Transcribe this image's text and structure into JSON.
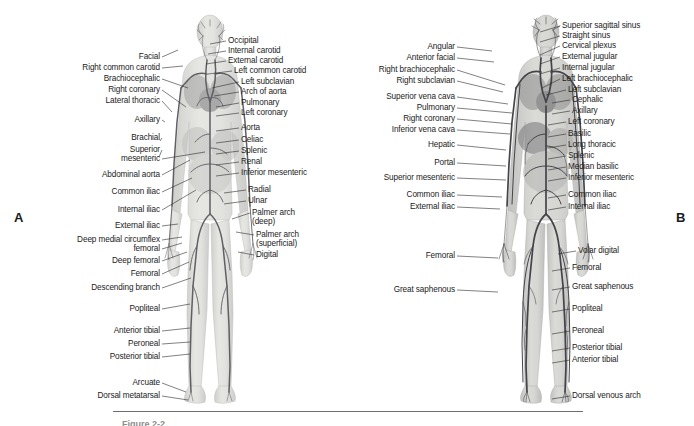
{
  "figure": {
    "background_color": "#ffffff",
    "text_color": "#1b1b1b",
    "leader_color": "#2b2b2b",
    "rule_color": "#6d6d6d"
  },
  "panel_a": {
    "letter": "A",
    "subject": "arterial-system",
    "art_tone_light": "#d9d9d6",
    "art_tone_vessel": "#6e6e72",
    "labels_left": [
      {
        "text": "Facial",
        "x": 160,
        "y": 57,
        "tx": 205,
        "ty": 60,
        "px": 178,
        "py": 50
      },
      {
        "text": "Right common carotid",
        "x": 160,
        "y": 68,
        "tx": 205,
        "ty": 71,
        "px": 183,
        "py": 66
      },
      {
        "text": "Brachiocephalic",
        "x": 160,
        "y": 79,
        "tx": 205,
        "ty": 82,
        "px": 188,
        "py": 88
      },
      {
        "text": "Right coronary",
        "x": 160,
        "y": 90,
        "tx": 205,
        "ty": 93,
        "px": 186,
        "py": 107
      },
      {
        "text": "Lateral thoracic",
        "x": 160,
        "y": 101,
        "tx": 205,
        "ty": 104,
        "px": 172,
        "py": 112
      },
      {
        "text": "Axillary",
        "x": 160,
        "y": 120,
        "tx": 205,
        "ty": 123,
        "px": 165,
        "py": 122
      },
      {
        "text": "Brachial",
        "x": 160,
        "y": 138,
        "tx": 205,
        "ty": 141,
        "px": 160,
        "py": 141
      },
      {
        "text": "Superior",
        "x": 160,
        "y": 150,
        "tx": 205,
        "ty": 153,
        "px": 159,
        "py": 157
      },
      {
        "text": "mesenteric",
        "x": 160,
        "y": 159,
        "tx": 205,
        "ty": 162,
        "px": 205,
        "py": 152
      },
      {
        "text": "Abdominal aorta",
        "x": 160,
        "y": 175,
        "tx": 205,
        "ty": 178,
        "px": 190,
        "py": 160
      },
      {
        "text": "Common iliac",
        "x": 160,
        "y": 192,
        "tx": 205,
        "ty": 195,
        "px": 192,
        "py": 178
      },
      {
        "text": "Internal iliac",
        "x": 160,
        "y": 210,
        "tx": 205,
        "ty": 213,
        "px": 196,
        "py": 190
      },
      {
        "text": "External iliac",
        "x": 160,
        "y": 226,
        "tx": 205,
        "ty": 229,
        "px": 178,
        "py": 224
      },
      {
        "text": "Deep medial circumflex",
        "x": 160,
        "y": 240,
        "tx": 205,
        "ty": 243,
        "px": 182,
        "py": 237
      },
      {
        "text": "femoral",
        "x": 160,
        "y": 249,
        "tx": 205,
        "ty": 252,
        "px": 182,
        "py": 243
      },
      {
        "text": "Deep femoral",
        "x": 160,
        "y": 261,
        "tx": 205,
        "ty": 264,
        "px": 187,
        "py": 252
      },
      {
        "text": "Femoral",
        "x": 160,
        "y": 274,
        "tx": 205,
        "ty": 277,
        "px": 189,
        "py": 262
      },
      {
        "text": "Descending branch",
        "x": 160,
        "y": 288,
        "tx": 205,
        "ty": 291,
        "px": 191,
        "py": 278
      },
      {
        "text": "Popliteal",
        "x": 160,
        "y": 309,
        "tx": 205,
        "ty": 312,
        "px": 190,
        "py": 304
      },
      {
        "text": "Anterior tibial",
        "x": 160,
        "y": 331,
        "tx": 205,
        "ty": 334,
        "px": 190,
        "py": 328
      },
      {
        "text": "Peroneal",
        "x": 160,
        "y": 344,
        "tx": 205,
        "ty": 347,
        "px": 190,
        "py": 342
      },
      {
        "text": "Posterior tibial",
        "x": 160,
        "y": 357,
        "tx": 205,
        "ty": 360,
        "px": 190,
        "py": 354
      },
      {
        "text": "Arcuate",
        "x": 160,
        "y": 383,
        "tx": 205,
        "ty": 386,
        "px": 186,
        "py": 392
      },
      {
        "text": "Dorsal metatarsal",
        "x": 160,
        "y": 396,
        "tx": 205,
        "ty": 399,
        "px": 188,
        "py": 400
      }
    ],
    "labels_right": [
      {
        "text": "Occipital",
        "x": 228,
        "y": 41,
        "px": 210,
        "py": 44
      },
      {
        "text": "Internal carotid",
        "x": 228,
        "y": 51,
        "px": 208,
        "py": 54
      },
      {
        "text": "External carotid",
        "x": 228,
        "y": 61,
        "px": 206,
        "py": 64
      },
      {
        "text": "Left common carotid",
        "x": 234,
        "y": 71,
        "px": 208,
        "py": 74
      },
      {
        "text": "Left subclavian",
        "x": 241,
        "y": 82,
        "px": 212,
        "py": 88
      },
      {
        "text": "Arch of aorta",
        "x": 241,
        "y": 92,
        "px": 214,
        "py": 96
      },
      {
        "text": "Pulmonary",
        "x": 241,
        "y": 103,
        "px": 216,
        "py": 107
      },
      {
        "text": "Left coronary",
        "x": 241,
        "y": 113,
        "px": 216,
        "py": 116
      },
      {
        "text": "Aorta",
        "x": 241,
        "y": 128,
        "px": 216,
        "py": 131
      },
      {
        "text": "Celiac",
        "x": 241,
        "y": 140,
        "px": 216,
        "py": 143
      },
      {
        "text": "Splenic",
        "x": 241,
        "y": 151,
        "px": 216,
        "py": 154
      },
      {
        "text": "Renal",
        "x": 241,
        "y": 162,
        "px": 216,
        "py": 165
      },
      {
        "text": "Inferior mesenteric",
        "x": 241,
        "y": 173,
        "px": 216,
        "py": 176
      },
      {
        "text": "Radial",
        "x": 248,
        "y": 190,
        "px": 224,
        "py": 193
      },
      {
        "text": "Ulnar",
        "x": 248,
        "y": 201,
        "px": 224,
        "py": 204
      },
      {
        "text": "Palmer arch",
        "x": 252,
        "y": 213,
        "px": 232,
        "py": 219
      },
      {
        "text": "(deep)",
        "x": 252,
        "y": 222,
        "px": 0,
        "py": 0
      },
      {
        "text": "Palmer arch",
        "x": 256,
        "y": 235,
        "px": 236,
        "py": 232
      },
      {
        "text": "(superficial)",
        "x": 256,
        "y": 244,
        "px": 0,
        "py": 0
      },
      {
        "text": "Digital",
        "x": 256,
        "y": 255,
        "px": 238,
        "py": 252
      }
    ]
  },
  "panel_b": {
    "letter": "B",
    "subject": "venous-system",
    "art_tone_light": "#c9c9c7",
    "art_tone_vessel": "#4d4d52",
    "labels_left": [
      {
        "text": "Angular",
        "x": 455,
        "y": 47,
        "px": 492,
        "py": 51
      },
      {
        "text": "Anterior facial",
        "x": 455,
        "y": 58,
        "px": 494,
        "py": 62
      },
      {
        "text": "Right brachiocephalic",
        "x": 455,
        "y": 70,
        "px": 505,
        "py": 85
      },
      {
        "text": "Right subclavian",
        "x": 455,
        "y": 81,
        "px": 503,
        "py": 92
      },
      {
        "text": "Superior vena cava",
        "x": 455,
        "y": 97,
        "px": 508,
        "py": 104
      },
      {
        "text": "Pulmonary",
        "x": 455,
        "y": 108,
        "px": 512,
        "py": 113
      },
      {
        "text": "Right coronary",
        "x": 455,
        "y": 119,
        "px": 512,
        "py": 124
      },
      {
        "text": "Inferior vena cava",
        "x": 455,
        "y": 130,
        "px": 510,
        "py": 134
      },
      {
        "text": "Hepatic",
        "x": 455,
        "y": 145,
        "px": 506,
        "py": 150
      },
      {
        "text": "Portal",
        "x": 455,
        "y": 163,
        "px": 506,
        "py": 166
      },
      {
        "text": "Superior mesenteric",
        "x": 455,
        "y": 178,
        "px": 506,
        "py": 180
      },
      {
        "text": "Common iliac",
        "x": 455,
        "y": 195,
        "px": 502,
        "py": 197
      },
      {
        "text": "External iliac",
        "x": 455,
        "y": 207,
        "px": 500,
        "py": 209
      },
      {
        "text": "Femoral",
        "x": 455,
        "y": 256,
        "px": 498,
        "py": 258
      },
      {
        "text": "Great saphenous",
        "x": 455,
        "y": 290,
        "px": 498,
        "py": 292
      }
    ],
    "labels_right": [
      {
        "text": "Superior sagittal sinus",
        "x": 562,
        "y": 26,
        "px": 540,
        "py": 32
      },
      {
        "text": "Straight sinus",
        "x": 562,
        "y": 36,
        "px": 540,
        "py": 42
      },
      {
        "text": "Cervical plexus",
        "x": 562,
        "y": 46,
        "px": 540,
        "py": 55
      },
      {
        "text": "External jugular",
        "x": 562,
        "y": 57,
        "px": 540,
        "py": 64
      },
      {
        "text": "Internal jugular",
        "x": 562,
        "y": 68,
        "px": 540,
        "py": 74
      },
      {
        "text": "Left brachiocephalic",
        "x": 562,
        "y": 79,
        "px": 542,
        "py": 88
      },
      {
        "text": "Left subclavian",
        "x": 568,
        "y": 90,
        "px": 546,
        "py": 95
      },
      {
        "text": "Cephalic",
        "x": 572,
        "y": 100,
        "px": 552,
        "py": 103
      },
      {
        "text": "Axillary",
        "x": 572,
        "y": 111,
        "px": 552,
        "py": 114
      },
      {
        "text": "Left coronary",
        "x": 568,
        "y": 122,
        "px": 548,
        "py": 125
      },
      {
        "text": "Basilic",
        "x": 568,
        "y": 134,
        "px": 548,
        "py": 137
      },
      {
        "text": "Long thoracic",
        "x": 568,
        "y": 145,
        "px": 548,
        "py": 148
      },
      {
        "text": "Splenic",
        "x": 568,
        "y": 156,
        "px": 548,
        "py": 159
      },
      {
        "text": "Median basilic",
        "x": 568,
        "y": 167,
        "px": 548,
        "py": 170
      },
      {
        "text": "Inferior mesenteric",
        "x": 568,
        "y": 178,
        "px": 548,
        "py": 181
      },
      {
        "text": "Common iliac",
        "x": 568,
        "y": 195,
        "px": 548,
        "py": 198
      },
      {
        "text": "Internal iliac",
        "x": 568,
        "y": 207,
        "px": 548,
        "py": 210
      },
      {
        "text": "Volar digital",
        "x": 578,
        "y": 251,
        "px": 558,
        "py": 254
      },
      {
        "text": "Femoral",
        "x": 572,
        "y": 268,
        "px": 552,
        "py": 271
      },
      {
        "text": "Great saphenous",
        "x": 572,
        "y": 287,
        "px": 552,
        "py": 290
      },
      {
        "text": "Popliteal",
        "x": 572,
        "y": 309,
        "px": 552,
        "py": 312
      },
      {
        "text": "Peroneal",
        "x": 572,
        "y": 331,
        "px": 552,
        "py": 334
      },
      {
        "text": "Posterior tibial",
        "x": 572,
        "y": 348,
        "px": 552,
        "py": 351
      },
      {
        "text": "Anterior tibial",
        "x": 572,
        "y": 360,
        "px": 552,
        "py": 363
      },
      {
        "text": "Dorsal venous arch",
        "x": 572,
        "y": 396,
        "px": 552,
        "py": 399
      }
    ]
  },
  "footer": {
    "rule_x": 113,
    "rule_y": 411,
    "rule_width": 470,
    "caption_partial": "Figure 2-2"
  }
}
